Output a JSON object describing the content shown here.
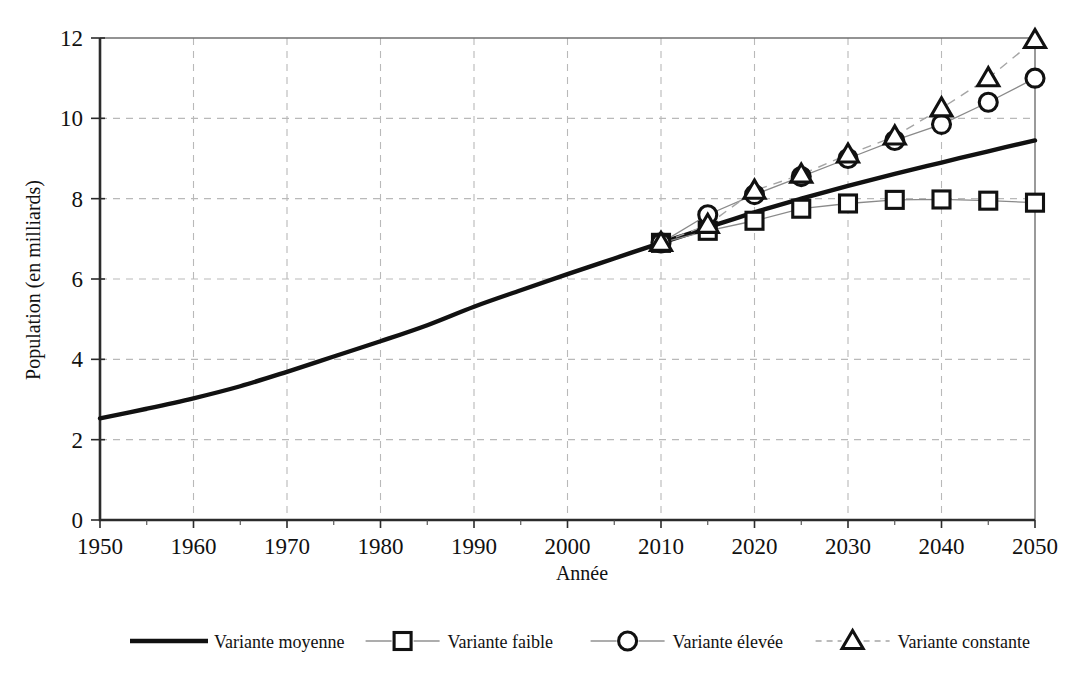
{
  "chart_data": {
    "type": "line",
    "title": "",
    "xlabel": "Année",
    "ylabel": "Population (en milliards)",
    "xlim": [
      1950,
      2050
    ],
    "ylim": [
      0,
      12
    ],
    "xticks": [
      1950,
      1960,
      1970,
      1980,
      1990,
      2000,
      2010,
      2020,
      2030,
      2040,
      2050
    ],
    "yticks": [
      0,
      2,
      4,
      6,
      8,
      10,
      12
    ],
    "xtick_labels": [
      "1950",
      "1960",
      "1970",
      "1980",
      "1990",
      "2000",
      "2010",
      "2020",
      "2030",
      "2040",
      "2050"
    ],
    "ytick_labels": [
      "0",
      "2",
      "4",
      "6",
      "8",
      "10",
      "12"
    ],
    "minor_xtick_step": 5,
    "grid": true,
    "grid_style": "dashed",
    "grid_color": "#b9b9b9",
    "legend_position": "bottom",
    "series": [
      {
        "name": "Variante moyenne",
        "marker": "none",
        "linestyle": "solid-thick",
        "color": "#111111",
        "x": [
          1950,
          1955,
          1960,
          1965,
          1970,
          1975,
          1980,
          1985,
          1990,
          1995,
          2000,
          2005,
          2010,
          2015,
          2020,
          2025,
          2030,
          2035,
          2040,
          2045,
          2050
        ],
        "values": [
          2.53,
          2.77,
          3.03,
          3.33,
          3.69,
          4.07,
          4.45,
          4.85,
          5.31,
          5.72,
          6.12,
          6.51,
          6.9,
          7.28,
          7.66,
          8.0,
          8.32,
          8.62,
          8.9,
          9.18,
          9.45
        ]
      },
      {
        "name": "Variante faible",
        "marker": "square",
        "linestyle": "solid-thin",
        "color": "#8a8a8a",
        "x": [
          2010,
          2015,
          2020,
          2025,
          2030,
          2035,
          2040,
          2045,
          2050
        ],
        "values": [
          6.9,
          7.2,
          7.45,
          7.75,
          7.88,
          7.97,
          7.98,
          7.95,
          7.9
        ]
      },
      {
        "name": "Variante élevée",
        "marker": "circle",
        "linestyle": "solid-thin",
        "color": "#8a8a8a",
        "x": [
          2010,
          2015,
          2020,
          2025,
          2030,
          2035,
          2040,
          2045,
          2050
        ],
        "values": [
          6.9,
          7.6,
          8.1,
          8.55,
          9.0,
          9.45,
          9.85,
          10.4,
          11.0
        ]
      },
      {
        "name": "Variante constante",
        "marker": "triangle",
        "linestyle": "dashed",
        "color": "#a5a5a5",
        "x": [
          2010,
          2015,
          2020,
          2025,
          2030,
          2035,
          2040,
          2045,
          2050
        ],
        "values": [
          6.9,
          7.35,
          8.2,
          8.6,
          9.1,
          9.55,
          10.25,
          11.0,
          11.95
        ]
      }
    ],
    "legend_entries": [
      {
        "label": "Variante moyenne",
        "marker": "none",
        "style": "solid-thick"
      },
      {
        "label": "Variante faible",
        "marker": "square",
        "style": "solid-thin"
      },
      {
        "label": "Variante élevée",
        "marker": "circle",
        "style": "solid-thin"
      },
      {
        "label": "Variante constante",
        "marker": "triangle",
        "style": "dashed"
      }
    ]
  }
}
